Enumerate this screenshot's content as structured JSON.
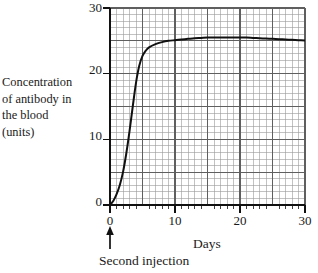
{
  "chart_data": {
    "type": "line",
    "title": "",
    "xlabel": "Days",
    "ylabel": "Concentration of antibody in the blood (units)",
    "ylabel_lines": [
      "Concentration",
      "of antibody in",
      "the blood",
      "(units)"
    ],
    "xlim": [
      0,
      30
    ],
    "ylim": [
      0,
      30
    ],
    "x_ticks": [
      0,
      10,
      20,
      30
    ],
    "x_tick_labels": [
      "0",
      "10",
      "20",
      "30"
    ],
    "y_ticks": [
      0,
      10,
      20,
      30
    ],
    "y_tick_labels": [
      "0",
      "10",
      "20",
      "30"
    ],
    "x_minor_step": 1,
    "x_major_step": 5,
    "y_minor_step": 1,
    "y_major_step": 5,
    "grid": true,
    "legend": false,
    "legend_position": "none",
    "series": [
      {
        "name": "Antibody concentration after second injection",
        "x": [
          0,
          0.5,
          1,
          1.5,
          2,
          2.5,
          3,
          3.5,
          4,
          4.5,
          5,
          5.5,
          6,
          7,
          8,
          9,
          10,
          11,
          12,
          13,
          14,
          15,
          16,
          17,
          18,
          19,
          20,
          21,
          22,
          23,
          24,
          25,
          26,
          27,
          28,
          29,
          30
        ],
        "values": [
          0,
          0.6,
          1.6,
          3.0,
          5.0,
          7.8,
          11.2,
          15.0,
          18.6,
          21.2,
          22.7,
          23.5,
          24.0,
          24.5,
          24.8,
          25.0,
          25.1,
          25.2,
          25.3,
          25.4,
          25.45,
          25.5,
          25.5,
          25.5,
          25.5,
          25.5,
          25.5,
          25.5,
          25.45,
          25.4,
          25.35,
          25.3,
          25.25,
          25.2,
          25.15,
          25.1,
          25.05
        ]
      }
    ],
    "annotations": [
      {
        "name": "second-injection",
        "label": "Second injection",
        "x": 0,
        "y": 0,
        "marker": "up-arrow"
      }
    ],
    "colors": {
      "curve": "#111111",
      "axis": "#111111",
      "grid_minor": "#9a9a9a",
      "grid_major": "#5f5f5f",
      "background": "#ffffff",
      "text": "#1a1a1a"
    }
  },
  "labels": {
    "x_axis_name": "Days",
    "y_axis_line_1": "Concentration",
    "y_axis_line_2": "of antibody in",
    "y_axis_line_3": "the blood",
    "y_axis_line_4": "(units)",
    "annotation_text": "Second injection",
    "y_tick_0": "0",
    "y_tick_10": "10",
    "y_tick_20": "20",
    "y_tick_30": "30",
    "x_tick_0": "0",
    "x_tick_10": "10",
    "x_tick_20": "20",
    "x_tick_30": "30"
  }
}
